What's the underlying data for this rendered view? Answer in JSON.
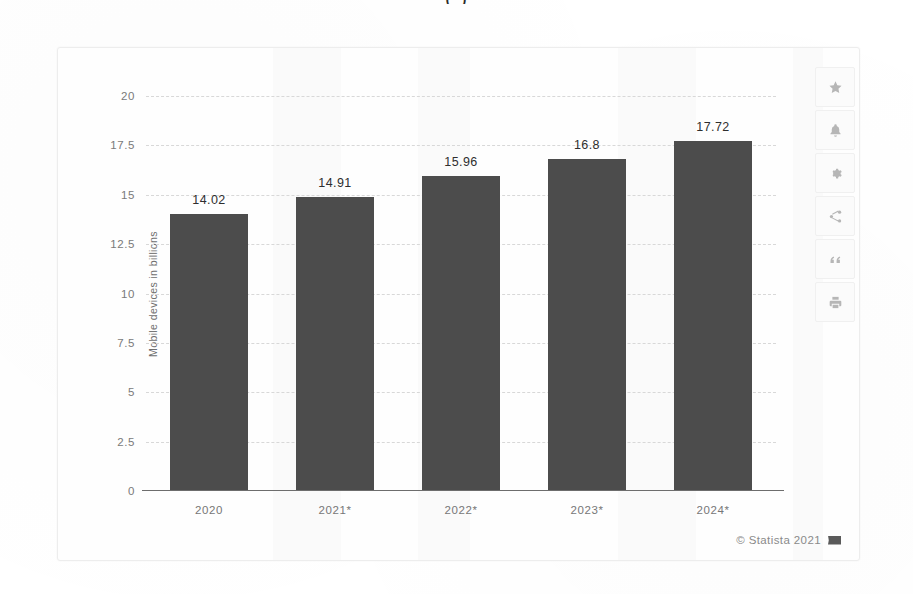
{
  "clipped_title": "(             )",
  "chart_data": {
    "type": "bar",
    "title": "",
    "xlabel": "",
    "ylabel": "Mobile devices in billions",
    "categories": [
      "2020",
      "2021*",
      "2022*",
      "2023*",
      "2024*"
    ],
    "values": [
      14.02,
      14.91,
      15.96,
      16.8,
      17.72
    ],
    "value_labels": [
      "14.02",
      "14.91",
      "15.96",
      "16.8",
      "17.72"
    ],
    "ylim": [
      0,
      20
    ],
    "yticks": [
      20,
      17.5,
      15,
      12.5,
      10,
      7.5,
      5,
      2.5,
      0
    ],
    "ytick_labels": [
      "20",
      "17.5",
      "15",
      "12.5",
      "10",
      "7.5",
      "5",
      "2.5",
      "0"
    ],
    "grid": true,
    "legend": false,
    "bar_color": "#4c4c4c",
    "grid_color": "#d8d8d8",
    "axis_color": "#6d6d6d"
  },
  "toolbar": {
    "items": [
      {
        "icon": "star-icon",
        "label": "Add to favorites"
      },
      {
        "icon": "bell-icon",
        "label": "Create alert"
      },
      {
        "icon": "gear-icon",
        "label": "Settings"
      },
      {
        "icon": "share-icon",
        "label": "Share"
      },
      {
        "icon": "quote-icon",
        "label": "Cite"
      },
      {
        "icon": "print-icon",
        "label": "Print"
      }
    ]
  },
  "credit": {
    "text": "© Statista 2021",
    "flag": "flag-icon"
  }
}
